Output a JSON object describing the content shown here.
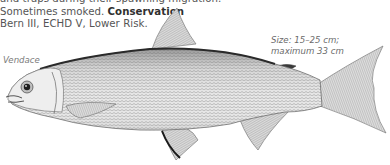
{
  "text": {
    "line1": "and traps during their spawning migration.",
    "line2_prefix": "Sometimes smoked.",
    "line2_bold": "Conservation",
    "line3": "Bern III, ECHD V, Lower Risk."
  },
  "size_note": {
    "line1": "Size: 15–25 cm;",
    "line2": "maximum 33 cm"
  },
  "caption": "Vendace",
  "illustration": {
    "subject": "fish-illustration",
    "body_color": "#d9d9d9",
    "outline_color": "#5a5a5a",
    "dark_accent": "#222222"
  }
}
